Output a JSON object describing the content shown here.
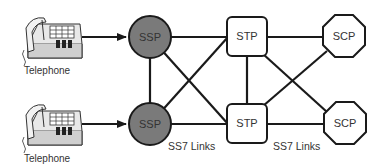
{
  "diagram": {
    "colors": {
      "ssp_fill": "#7a7a7a",
      "stroke": "#1a1a1a",
      "node_fill": "#ffffff",
      "text": "#333333"
    },
    "telephones": [
      {
        "label": "Telephone"
      },
      {
        "label": "Telephone"
      }
    ],
    "nodes": {
      "ssp_top": {
        "label": "SSP",
        "shape": "circle"
      },
      "ssp_bottom": {
        "label": "SSP",
        "shape": "circle"
      },
      "stp_top": {
        "label": "STP",
        "shape": "rounded-rect"
      },
      "stp_bottom": {
        "label": "STP",
        "shape": "rounded-rect"
      },
      "scp_top": {
        "label": "SCP",
        "shape": "octagon"
      },
      "scp_bottom": {
        "label": "SCP",
        "shape": "octagon"
      }
    },
    "link_labels": [
      "SS7 Links",
      "SS7 Links"
    ],
    "edges": [
      [
        "telephone_top",
        "ssp_top"
      ],
      [
        "telephone_bottom",
        "ssp_bottom"
      ],
      [
        "ssp_top",
        "stp_top"
      ],
      [
        "ssp_top",
        "stp_bottom"
      ],
      [
        "ssp_top",
        "ssp_bottom"
      ],
      [
        "ssp_bottom",
        "stp_top"
      ],
      [
        "ssp_bottom",
        "stp_bottom"
      ],
      [
        "stp_top",
        "stp_bottom"
      ],
      [
        "stp_top",
        "scp_top"
      ],
      [
        "stp_top",
        "scp_bottom"
      ],
      [
        "stp_bottom",
        "scp_top"
      ],
      [
        "stp_bottom",
        "scp_bottom"
      ]
    ]
  }
}
